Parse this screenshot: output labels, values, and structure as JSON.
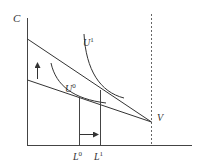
{
  "diagram": {
    "y_axis_label": "C",
    "x_axis_markers": [
      {
        "base": "L",
        "sup": "0"
      },
      {
        "base": "L",
        "sup": "1"
      }
    ],
    "curves": [
      {
        "base": "U",
        "sup": "1"
      },
      {
        "base": "U",
        "sup": "0"
      }
    ],
    "endpoint_label": "V",
    "colors": {
      "line": "#333333",
      "background": "#ffffff"
    }
  }
}
